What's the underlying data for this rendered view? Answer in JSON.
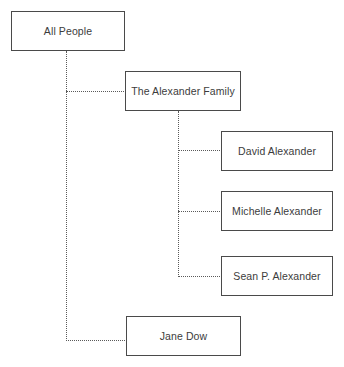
{
  "diagram": {
    "type": "tree-hierarchy",
    "title": "All People",
    "background_color": "#ffffff",
    "box_border_color": "#4a4a4a",
    "connector_color": "#5a5a5a",
    "text_color": "#3c3c3c",
    "nodes": [
      {
        "id": "all-people",
        "label": "All People",
        "level": 0,
        "parent": null
      },
      {
        "id": "alexander-family",
        "label": "The Alexander Family",
        "level": 1,
        "parent": "all-people"
      },
      {
        "id": "david-alexander",
        "label": "David Alexander",
        "level": 2,
        "parent": "alexander-family"
      },
      {
        "id": "michelle-alexander",
        "label": "Michelle Alexander",
        "level": 2,
        "parent": "alexander-family"
      },
      {
        "id": "sean-p-alexander",
        "label": "Sean P. Alexander",
        "level": 2,
        "parent": "alexander-family"
      },
      {
        "id": "jane-dow",
        "label": "Jane Dow",
        "level": 1,
        "parent": "all-people"
      }
    ]
  }
}
